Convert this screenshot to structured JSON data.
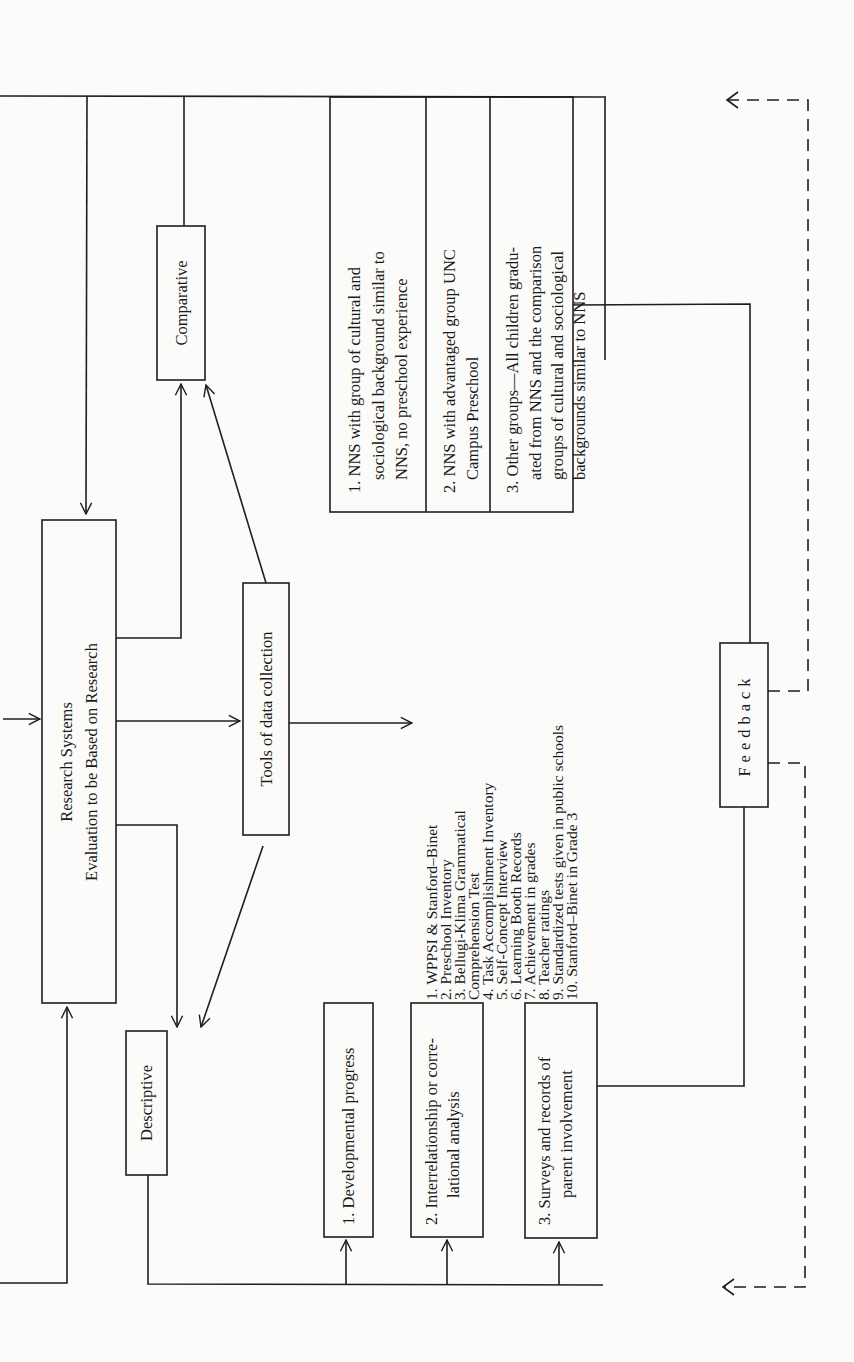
{
  "diagram": {
    "central": {
      "line1": "Research Systems",
      "line2": "Evaluation to be Based on Research"
    },
    "comparative": {
      "label": "Comparative"
    },
    "descriptive": {
      "label": "Descriptive"
    },
    "tools": {
      "label": "Tools of data collection"
    },
    "feedback": {
      "label": "Feedback"
    },
    "comparison_groups": [
      {
        "lines": [
          "1. NNS with group of cultural and",
          "sociological background similar to",
          "NNS, no preschool experience"
        ]
      },
      {
        "lines": [
          "2. NNS with advantaged group UNC",
          "Campus Preschool"
        ]
      },
      {
        "lines": [
          "3. Other groups—All children gradu-",
          "ated from NNS and the comparison",
          "groups of cultural and sociological",
          "backgrounds similar to NNS"
        ]
      }
    ],
    "tools_list": [
      "1.  WPPSI & Stanford–Binet",
      "2.  Preschool Inventory",
      "3.  Bellugi-Klima Grammatical",
      "      Comprehension Test",
      "4.  Task Accomplishment Inventory",
      "5.  Self-Concept Interview",
      "6.  Learning Booth Records",
      "7.  Achievement in grades",
      "8.  Teacher ratings",
      "9.  Standardized tests given in public schools",
      "10. Stanford–Binet in Grade 3"
    ],
    "descriptive_items": [
      {
        "lines": [
          "1.  Developmental progress"
        ]
      },
      {
        "lines": [
          "2.  Interrelationship or corre-",
          "lational analysis"
        ]
      },
      {
        "lines": [
          "3.  Surveys and records of",
          "parent involvement"
        ]
      }
    ]
  }
}
